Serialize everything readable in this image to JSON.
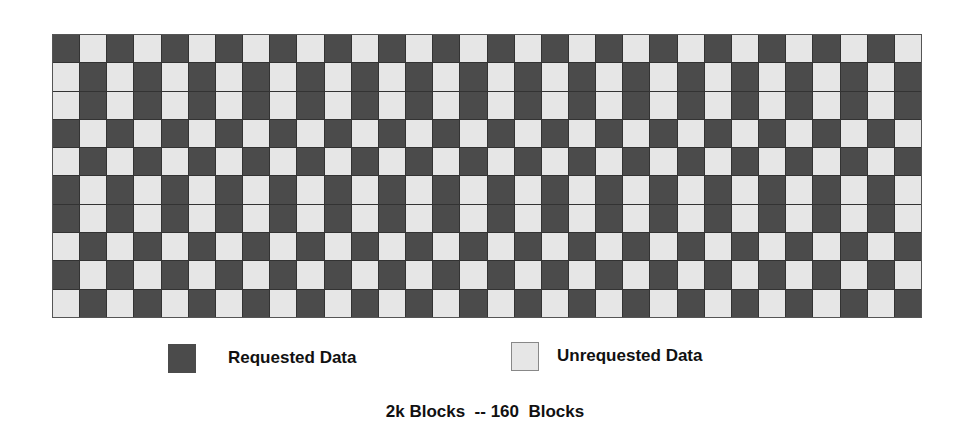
{
  "diagram": {
    "rows": 10,
    "columns": 32,
    "row_first_cell": [
      "requested",
      "unrequested",
      "unrequested",
      "requested",
      "unrequested",
      "requested",
      "requested",
      "unrequested",
      "requested",
      "unrequested"
    ],
    "pattern": "alternating per row"
  },
  "colors": {
    "requested": "#4b4b4b",
    "unrequested": "#e6e6e6",
    "gridline": "#333333"
  },
  "legend": {
    "requested_label": "Requested Data",
    "unrequested_label": "Unrequested Data"
  },
  "caption": "2k Blocks  -- 160  Blocks"
}
